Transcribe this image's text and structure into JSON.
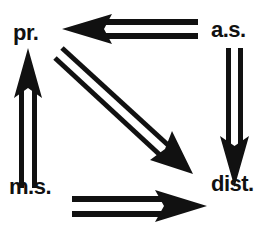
{
  "diagram": {
    "nodes": [
      {
        "id": "pr",
        "label": "pr."
      },
      {
        "id": "as",
        "label": "a.s."
      },
      {
        "id": "ms",
        "label": "m.s."
      },
      {
        "id": "dist",
        "label": "dist."
      }
    ],
    "edges": [
      {
        "from": "as",
        "to": "pr",
        "style": "double-line arrow"
      },
      {
        "from": "as",
        "to": "dist",
        "style": "double-line arrow"
      },
      {
        "from": "ms",
        "to": "pr",
        "style": "double-line arrow"
      },
      {
        "from": "ms",
        "to": "dist",
        "style": "double-line arrow"
      },
      {
        "from": "pr",
        "to": "dist",
        "style": "double-line arrow"
      }
    ],
    "colors": {
      "ink": "#111111",
      "background": "#ffffff"
    }
  }
}
